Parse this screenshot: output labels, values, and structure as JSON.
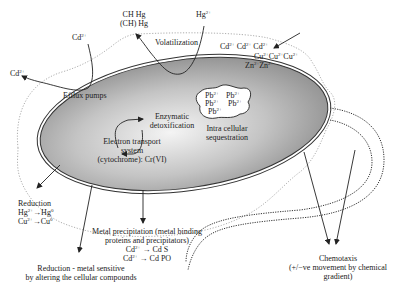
{
  "diagram": {
    "type": "bacterial metal resistance mechanisms",
    "cell_fill_gradient": [
      "#f2f2f2",
      "#bdbdbd",
      "#8c8c8c"
    ],
    "labels": {
      "ch3hg_line1": "CH Hg",
      "ch3hg_line2": "(CH) Hg",
      "hg_in": "Hg",
      "hg_in_charge": "2+",
      "volatilization": "Volatilization",
      "cd_top": "Cd",
      "cd_top_charge": "2+",
      "cd_left": "Cd",
      "cd_left_charge": "2+",
      "efflux_pumps": "Efflux pumps",
      "metals_row1": [
        "Cd",
        "Cd",
        "Cd"
      ],
      "metals_row2": [
        "Cu",
        "Cu",
        "Cu"
      ],
      "metals_row3": [
        "Zn",
        "Zn"
      ],
      "charge_2plus": "2+",
      "enzymatic_line1": "Enzymatic",
      "enzymatic_line2": "detoxification",
      "ets_line1": "Electron transport",
      "ets_line2": "system",
      "ets_line3": "(cytochrome): Cr(VI)",
      "pb_ion": "Pb",
      "sequestration_line1": "Intra cellular",
      "sequestration_line2": "sequestration",
      "reduction_title": "Reduction",
      "reduction_hg_from": "Hg",
      "reduction_hg_to": "Hg",
      "reduction_cu_from": "Cu",
      "reduction_cu_to": "Cu",
      "charge_zero": "0",
      "arrow": "→",
      "precip_line1": "Metal precipitation (metal binding",
      "precip_line2": "proteins and precipitators)",
      "precip_cds_from": "Cd",
      "precip_cds_to": "Cd S",
      "precip_cdpo_from": "Cd",
      "precip_cdpo_to": "Cd PO",
      "reduction_sensitive_line1": "Reduction - metal sensitive",
      "reduction_sensitive_line2": "by altering the cellular compounds",
      "chemotaxis_line1": "Chemotaxis",
      "chemotaxis_line2": "(+/−ve movement by chemical",
      "chemotaxis_line3": "gradient)"
    }
  }
}
